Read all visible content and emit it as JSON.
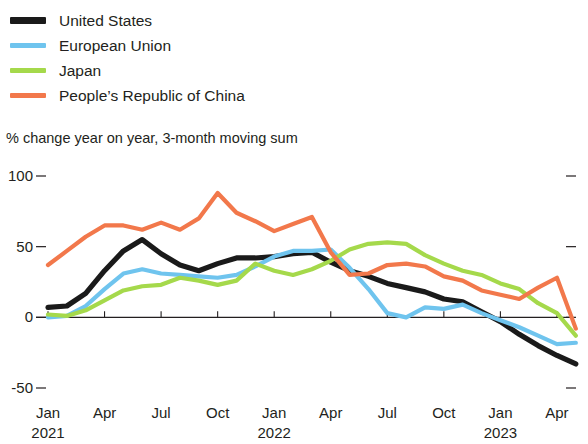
{
  "legend": {
    "items": [
      {
        "label": "United States",
        "color": "#1a1a1a",
        "key": "united_states"
      },
      {
        "label": "European Union",
        "color": "#6FC4EE",
        "key": "european_union"
      },
      {
        "label": "Japan",
        "color": "#A5D94B",
        "key": "japan"
      },
      {
        "label": "People’s Republic of China",
        "color": "#F2784B",
        "key": "china"
      }
    ]
  },
  "subtitle": "% change year on year, 3-month moving sum",
  "yaxis": {
    "ticks": [
      "100",
      "50",
      "0",
      "-50"
    ]
  },
  "xaxis": {
    "ticks": [
      {
        "month": "Jan",
        "year": "2021"
      },
      {
        "month": "Apr",
        "year": ""
      },
      {
        "month": "Jul",
        "year": ""
      },
      {
        "month": "Oct",
        "year": ""
      },
      {
        "month": "Jan",
        "year": "2022"
      },
      {
        "month": "Apr",
        "year": ""
      },
      {
        "month": "Jul",
        "year": ""
      },
      {
        "month": "Oct",
        "year": ""
      },
      {
        "month": "Jan",
        "year": "2023"
      },
      {
        "month": "Apr",
        "year": ""
      }
    ]
  },
  "chart_data": {
    "type": "line",
    "title": "",
    "subtitle": "% change year on year, 3-month moving sum",
    "xlabel": "",
    "ylabel": "% change year on year, 3-month moving sum",
    "ylim": [
      -50,
      100
    ],
    "yticks": [
      -50,
      0,
      50,
      100
    ],
    "grid": false,
    "legend_position": "top-left",
    "x": [
      "2021-01",
      "2021-02",
      "2021-03",
      "2021-04",
      "2021-05",
      "2021-06",
      "2021-07",
      "2021-08",
      "2021-09",
      "2021-10",
      "2021-11",
      "2021-12",
      "2022-01",
      "2022-02",
      "2022-03",
      "2022-04",
      "2022-05",
      "2022-06",
      "2022-07",
      "2022-08",
      "2022-09",
      "2022-10",
      "2022-11",
      "2022-12",
      "2023-01",
      "2023-02",
      "2023-03",
      "2023-04",
      "2023-05"
    ],
    "series": [
      {
        "name": "United States",
        "color": "#1a1a1a",
        "values": [
          7,
          8,
          17,
          33,
          47,
          55,
          45,
          37,
          33,
          38,
          42,
          42,
          43,
          45,
          46,
          39,
          33,
          29,
          24,
          21,
          18,
          13,
          11,
          4,
          -3,
          -12,
          -20,
          -27,
          -33
        ]
      },
      {
        "name": "European Union",
        "color": "#6FC4EE",
        "values": [
          0,
          1,
          8,
          20,
          31,
          34,
          31,
          30,
          29,
          28,
          30,
          36,
          43,
          47,
          47,
          48,
          35,
          20,
          3,
          0,
          7,
          6,
          9,
          3,
          -2,
          -7,
          -13,
          -19,
          -18
        ]
      },
      {
        "name": "Japan",
        "color": "#A5D94B",
        "values": [
          2,
          1,
          5,
          12,
          19,
          22,
          23,
          28,
          26,
          23,
          26,
          38,
          33,
          30,
          34,
          40,
          48,
          52,
          53,
          52,
          44,
          38,
          33,
          30,
          24,
          20,
          10,
          3,
          -13
        ]
      },
      {
        "name": "People’s Republic of China",
        "color": "#F2784B",
        "values": [
          37,
          47,
          57,
          65,
          65,
          62,
          67,
          62,
          70,
          88,
          74,
          68,
          61,
          66,
          71,
          46,
          30,
          31,
          37,
          38,
          36,
          29,
          26,
          19,
          16,
          13,
          21,
          28,
          -8
        ]
      }
    ]
  }
}
